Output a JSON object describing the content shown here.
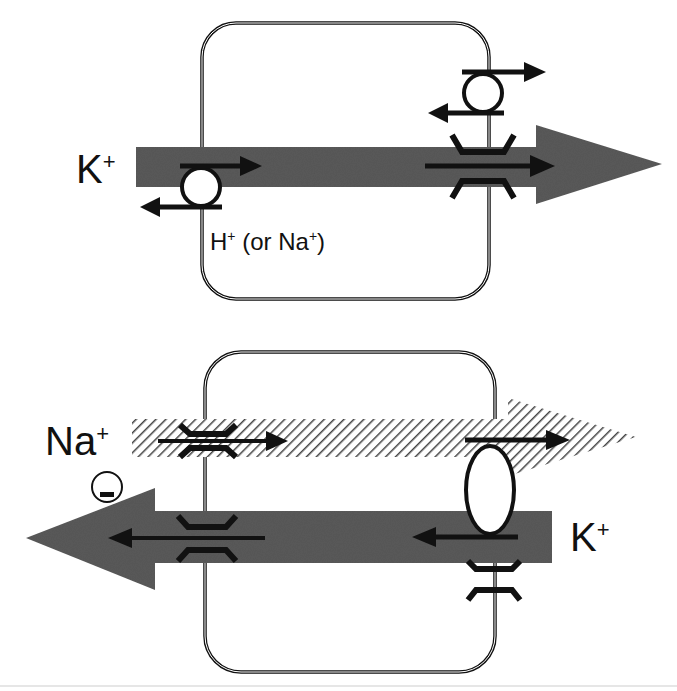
{
  "diagram": {
    "top_panel": {
      "ion_k_label": "K",
      "ion_k_sup": "+",
      "counter_ion_label": "H",
      "counter_ion_sup": "+",
      "counter_ion_alt": " (or Na",
      "counter_ion_alt_sup": "+",
      "counter_ion_alt_close": ")",
      "k_flux_direction": "left-to-right",
      "transporters": [
        "K+/H+ exchanger (apical)",
        "exchanger (basolateral)",
        "K+ channel (basolateral)"
      ]
    },
    "bottom_panel": {
      "na_label": "Na",
      "na_sup": "+",
      "k_label": "K",
      "k_sup": "+",
      "charge_symbol": "−",
      "na_flux_direction": "left-to-right (hatched)",
      "k_flux_direction": "right-to-left",
      "transporters": [
        "Na+ channel (apical)",
        "K+ channel (apical)",
        "Na+/K+ pump (basolateral)",
        "K+ channel (basolateral)"
      ]
    },
    "colors": {
      "flux_arrow": "#555555",
      "outline": "#111111",
      "hatch": "#444444",
      "background": "#ffffff"
    }
  }
}
